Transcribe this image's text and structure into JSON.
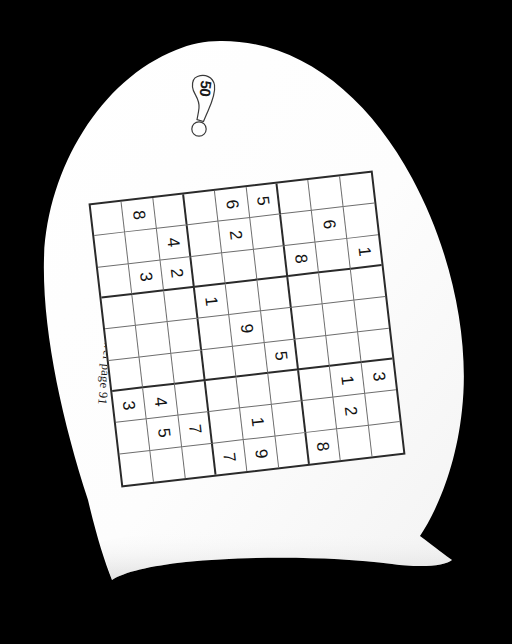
{
  "page": {
    "background_color": "#000000",
    "paper_color": "#fdfdfd",
    "ink_color": "#121212",
    "orientation_note": "page photographed rotated 90 degrees clockwise"
  },
  "badge": {
    "puzzle_number": "50",
    "icon": "lollipop-badge-icon"
  },
  "caption": {
    "answer_reference": "Answer page 91"
  },
  "grid": {
    "size": 9,
    "block": 3,
    "border_color": "#2a2a2a",
    "line_color": "#6e6e6e"
  },
  "chart_data": {
    "type": "table",
    "rows": 9,
    "columns": 9,
    "cells": [
      [
        "",
        "8",
        "",
        "",
        "6",
        "5",
        "",
        "",
        ""
      ],
      [
        "",
        "",
        "4",
        "",
        "2",
        "",
        "",
        "6",
        ""
      ],
      [
        "",
        "3",
        "2",
        "",
        "",
        "",
        "8",
        "",
        "1"
      ],
      [
        "",
        "",
        "",
        "1",
        "",
        "",
        "",
        "",
        ""
      ],
      [
        "",
        "",
        "",
        "",
        "9",
        "",
        "",
        "",
        ""
      ],
      [
        "",
        "",
        "",
        "",
        "",
        "5",
        "",
        "",
        ""
      ],
      [
        "3",
        "4",
        "",
        "",
        "",
        "",
        "",
        "1",
        "3"
      ],
      [
        "",
        "5",
        "7",
        "",
        "1",
        "",
        "",
        "2",
        ""
      ],
      [
        "",
        "",
        "",
        "7",
        "9",
        "",
        "8",
        "",
        ""
      ]
    ]
  }
}
